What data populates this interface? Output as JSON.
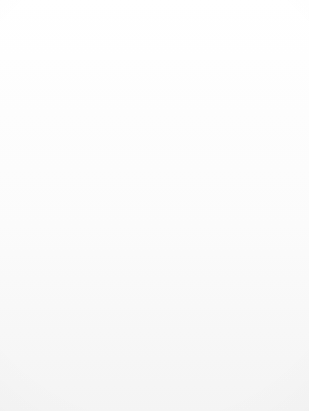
{
  "diagram": {
    "type": "venn",
    "title": "",
    "colors": {
      "background": "#fdfdfd",
      "left_only_fill": "#aeaeae",
      "intersection_fill": "#8c8c8e",
      "right_only_fill": "#6f6f73",
      "rim_highlight": "#f2f1ee",
      "arrow": "#b7b7b7",
      "leader_line": "#59595b",
      "text": "#141414"
    },
    "callouts": [
      {
        "id": "left",
        "lines": [
          "Percent of",
          "population (28%)",
          "with disorder",
          "(in one year)"
        ],
        "value_percent": 28,
        "arrow": "down-arrow-icon"
      },
      {
        "id": "right",
        "lines": [
          "Percent of",
          "population (15%)",
          "receiving",
          "mental health",
          "services",
          "(in one year)"
        ],
        "value_percent": 15,
        "arrow": "down-arrow-icon"
      }
    ],
    "regions": [
      {
        "id": "left-only",
        "lines": [
          "Diagnosis",
          "and",
          "no treatment",
          "(20%)"
        ],
        "value_percent": 20
      },
      {
        "id": "intersection",
        "lines": [
          "Diagnosis",
          "and",
          "treatment",
          "(8%)"
        ],
        "value_percent": 8
      },
      {
        "id": "right-only",
        "lines": [
          "Treatment",
          "and",
          "no diagnosis",
          "(7%)"
        ],
        "value_percent": 7
      }
    ]
  }
}
